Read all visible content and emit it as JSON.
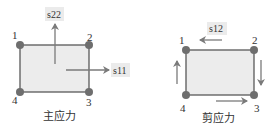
{
  "colors": {
    "element_fill": "#ececec",
    "element_stroke": "#595959",
    "node_fill": "#6e6e6e",
    "arrow": "#7a7a7a",
    "label_bg": "#ebebeb",
    "text": "#333333"
  },
  "principal": {
    "caption": "主应力",
    "nodes": [
      "1",
      "2",
      "3",
      "4"
    ],
    "labels": {
      "vertical": "s22",
      "horizontal": "s11"
    }
  },
  "shear": {
    "caption": "剪应力",
    "nodes": [
      "1",
      "2",
      "3",
      "4"
    ],
    "labels": {
      "top": "s12"
    }
  }
}
